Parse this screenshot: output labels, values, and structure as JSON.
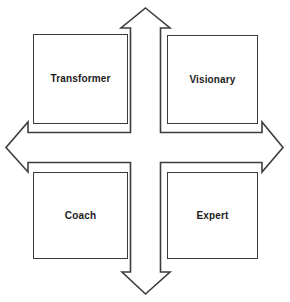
{
  "diagram": {
    "type": "quadrant-matrix",
    "title": "",
    "background_color": "#ffffff",
    "line_color": "#3d3d3d",
    "box_border_color": "#3a3a3a",
    "text_color": "#1c1c1c",
    "quadrants": [
      {
        "id": "transformer",
        "label": "Transformer",
        "position": "top-left"
      },
      {
        "id": "visionary",
        "label": "Visionary",
        "position": "top-right"
      },
      {
        "id": "coach",
        "label": "Coach",
        "position": "bottom-left"
      },
      {
        "id": "expert",
        "label": "Expert",
        "position": "bottom-right"
      }
    ],
    "axes": {
      "shape": "four-headed-cross-arrow",
      "arrowheads": [
        "up",
        "down",
        "left",
        "right"
      ],
      "up_label": "",
      "down_label": "",
      "left_label": "",
      "right_label": ""
    }
  }
}
